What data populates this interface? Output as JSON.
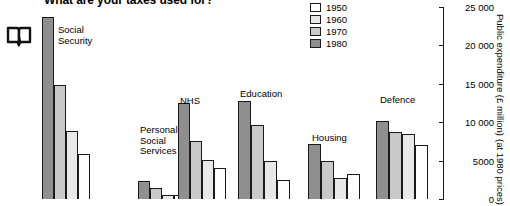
{
  "title": "What are your taxes used for?",
  "icon": "open-book-icon",
  "legend": [
    {
      "label": "1950",
      "color": "#ffffff"
    },
    {
      "label": "1960",
      "color": "#e8e8e8"
    },
    {
      "label": "1970",
      "color": "#c9c9c9"
    },
    {
      "label": "1980",
      "color": "#8f8f8f"
    }
  ],
  "axis": {
    "title_line1": "Public expenditure (£ million)",
    "title_line2": "(at 1980 prices)",
    "ticks": [
      "25 000",
      "20 000",
      "15 000",
      "10 000",
      "5000",
      "0"
    ]
  },
  "chart_data": {
    "type": "bar",
    "title": "What are your taxes used for?",
    "xlabel": "",
    "ylabel": "Public expenditure (£ million) (at 1980 prices)",
    "ylim": [
      0,
      25000
    ],
    "ytick_values": [
      0,
      5000,
      10000,
      15000,
      20000,
      25000
    ],
    "ytick_labels": [
      "0",
      "5000",
      "10 000",
      "15 000",
      "20 000",
      "25 000"
    ],
    "grid": false,
    "legend_position": "top-right",
    "bar_order": [
      "1980",
      "1970",
      "1960",
      "1950"
    ],
    "categories": [
      "Social Security",
      "Personal Social Services",
      "NHS",
      "Education",
      "Housing",
      "Defence"
    ],
    "series": [
      {
        "name": "1950",
        "color": "#ffffff",
        "values": [
          5800,
          500,
          4100,
          2500,
          3200,
          7000
        ]
      },
      {
        "name": "1960",
        "color": "#e8e8e8",
        "values": [
          8800,
          500,
          5100,
          4900,
          2800,
          8500
        ]
      },
      {
        "name": "1970",
        "color": "#c9c9c9",
        "values": [
          14900,
          1400,
          7500,
          9700,
          4900,
          8700
        ]
      },
      {
        "name": "1980",
        "color": "#8f8f8f",
        "values": [
          23700,
          2300,
          12500,
          12700,
          7100,
          10100
        ]
      }
    ]
  }
}
